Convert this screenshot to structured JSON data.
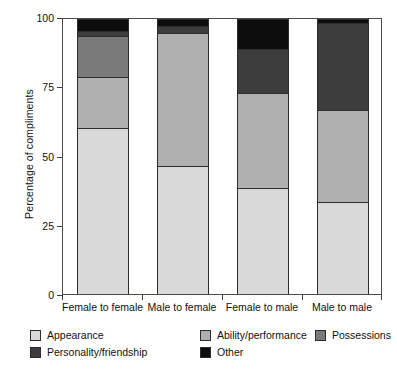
{
  "chart_data": {
    "type": "bar",
    "subtype": "stacked-percentage",
    "title": "",
    "xlabel": "",
    "ylabel": "Percentage of compliments",
    "ylim": [
      0,
      100
    ],
    "yticks": [
      0,
      25,
      50,
      75,
      100
    ],
    "ytick_labels": [
      "0",
      "25",
      "50",
      "75",
      "100"
    ],
    "grid": false,
    "legend_position": "below-axes",
    "categories": [
      "Female to female",
      "Male to female",
      "Female to male",
      "Male to male"
    ],
    "series": [
      {
        "name": "Appearance",
        "color": "#d9d9d9",
        "values": [
          60.5,
          46.5,
          38.5,
          33.5
        ]
      },
      {
        "name": "Ability/performance",
        "color": "#b0b0b0",
        "values": [
          18.5,
          48.5,
          34.5,
          33.5
        ]
      },
      {
        "name": "Possessions",
        "color": "#7a7a7a",
        "values": [
          15.0,
          0.0,
          0.0,
          0.0
        ]
      },
      {
        "name": "Personality/friendship",
        "color": "#3d3d3d",
        "values": [
          1.5,
          2.5,
          16.0,
          31.5
        ]
      },
      {
        "name": "Other",
        "color": "#0d0d0d",
        "values": [
          4.5,
          2.5,
          11.0,
          1.5
        ]
      }
    ]
  },
  "axis": {
    "y_title": "Percentage of compliments"
  },
  "legend": {
    "items": [
      {
        "label": "Appearance",
        "color": "#d9d9d9"
      },
      {
        "label": "Ability/performance",
        "color": "#b0b0b0"
      },
      {
        "label": "Possessions",
        "color": "#7a7a7a"
      },
      {
        "label": "Personality/friendship",
        "color": "#3d3d3d"
      },
      {
        "label": "Other",
        "color": "#0d0d0d"
      }
    ]
  }
}
